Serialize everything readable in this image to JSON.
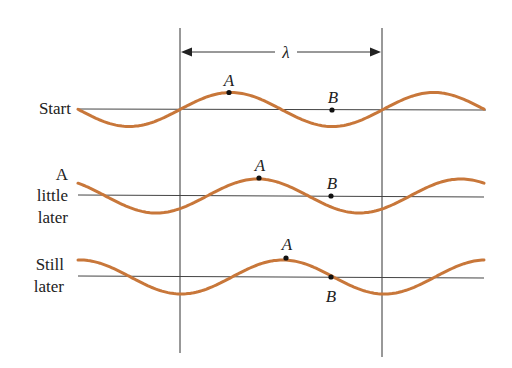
{
  "diagram": {
    "wavelength_label": "λ",
    "wave_color": "#C8773A",
    "line_color": "#333333",
    "rows": [
      {
        "label_lines": [
          "Start"
        ],
        "point_a": "A",
        "point_b": "B"
      },
      {
        "label_lines": [
          "A",
          "little",
          "later"
        ],
        "point_a": "A",
        "point_b": "B"
      },
      {
        "label_lines": [
          "Still",
          "later"
        ],
        "point_a": "A",
        "point_b": "B"
      }
    ]
  }
}
